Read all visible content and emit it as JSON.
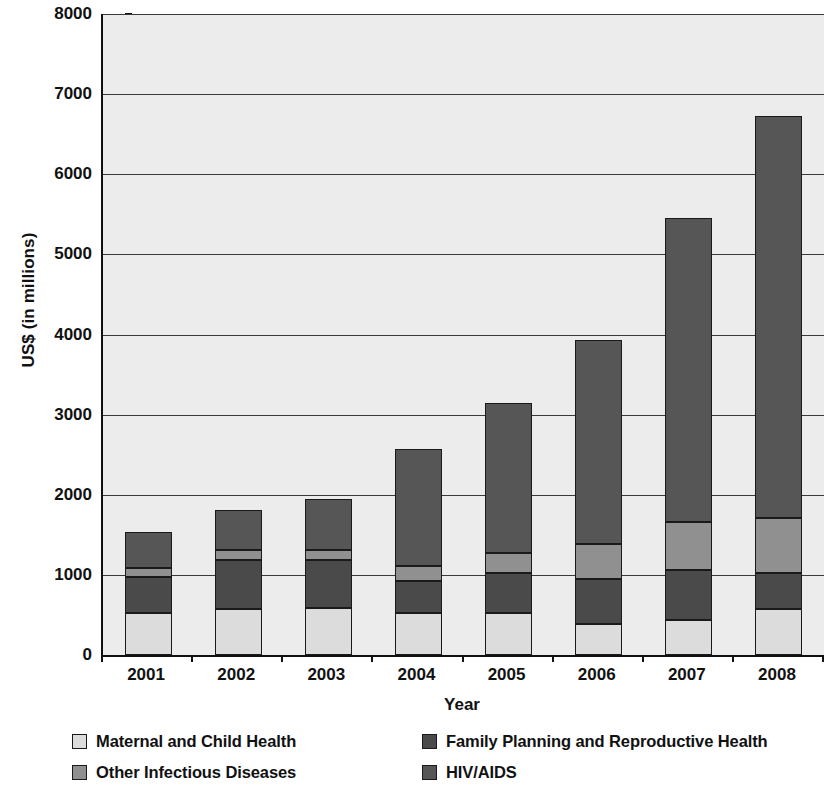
{
  "chart_data": {
    "type": "bar",
    "subtype": "stacked",
    "title": "",
    "xlabel": "Year",
    "ylabel": "US$ (in millions)",
    "categories": [
      "2001",
      "2002",
      "2003",
      "2004",
      "2005",
      "2006",
      "2007",
      "2008"
    ],
    "ylim": [
      0,
      8000
    ],
    "ytick_step": 1000,
    "yticks": [
      0,
      1000,
      2000,
      3000,
      4000,
      5000,
      6000,
      7000,
      8000
    ],
    "ytick_labels": [
      "0",
      "1000",
      "2000",
      "3000",
      "4000",
      "5000",
      "6000",
      "7000",
      "8000"
    ],
    "grid": true,
    "grid_axis": "y",
    "legend_position": "bottom",
    "stack_order_bottom_to_top": [
      "Maternal and Child Health",
      "Family Planning and Reproductive Health",
      "Other Infectious Diseases",
      "HIV/AIDS"
    ],
    "series": [
      {
        "name": "Maternal and Child Health",
        "color": "#dcdcdc",
        "values": [
          520,
          580,
          590,
          520,
          520,
          390,
          440,
          570
        ]
      },
      {
        "name": "Family Planning and Reproductive Health",
        "color": "#4a4a4a",
        "values": [
          450,
          610,
          590,
          400,
          500,
          560,
          620,
          450
        ]
      },
      {
        "name": "Other Infectious Diseases",
        "color": "#909090",
        "values": [
          120,
          120,
          130,
          190,
          250,
          430,
          600,
          690
        ]
      },
      {
        "name": "HIV/AIDS",
        "color": "#565656",
        "values": [
          440,
          500,
          640,
          1460,
          1880,
          2550,
          3790,
          5020
        ]
      }
    ],
    "totals": [
      1530,
      1810,
      1950,
      2570,
      3150,
      3930,
      5450,
      6730
    ]
  },
  "legend": {
    "entries": [
      {
        "label": "Maternal and Child Health",
        "color": "#dcdcdc",
        "icon": "legend-swatch-icon"
      },
      {
        "label": "Family Planning and Reproductive Health",
        "color": "#4a4a4a",
        "icon": "legend-swatch-icon"
      },
      {
        "label": "Other Infectious Diseases",
        "color": "#909090",
        "icon": "legend-swatch-icon"
      },
      {
        "label": "HIV/AIDS",
        "color": "#565656",
        "icon": "legend-swatch-icon"
      }
    ]
  },
  "colors": {
    "plot_background": "#ececec",
    "axis": "#111111",
    "gridline": "#3a3a3a",
    "bar_outline": "#1a1a1a",
    "page_background": "#ffffff"
  }
}
